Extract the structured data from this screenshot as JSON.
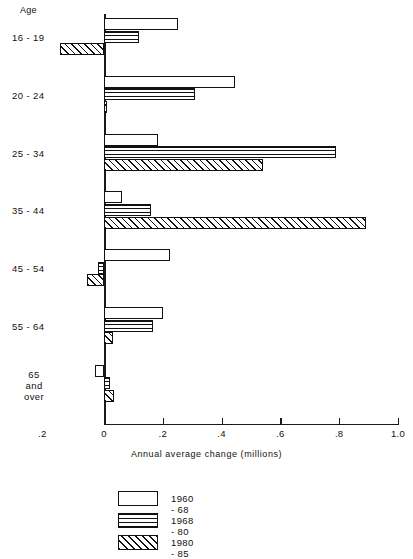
{
  "axis_header": "Age",
  "x_axis_title": "Annual average change (millions)",
  "x_ticks": [
    {
      "label": ".2",
      "value": -0.2
    },
    {
      "label": "0",
      "value": 0
    },
    {
      "label": ".2",
      "value": 0.2
    },
    {
      "label": ".4",
      "value": 0.4
    },
    {
      "label": ".6",
      "value": 0.6
    },
    {
      "label": ".8",
      "value": 0.8
    },
    {
      "label": "1.0",
      "value": 1.0
    }
  ],
  "legend": [
    {
      "label": "1960 - 68",
      "pattern": "solid-white"
    },
    {
      "label": "1968 - 80",
      "pattern": "horizontal-lines"
    },
    {
      "label": "1980 - 85",
      "pattern": "diagonal-hatch"
    }
  ],
  "chart_data": {
    "type": "bar",
    "orientation": "horizontal",
    "title": "",
    "xlabel": "Annual average change (millions)",
    "ylabel": "Age",
    "xlim": [
      -0.2,
      1.0
    ],
    "grid": false,
    "legend_position": "bottom",
    "categories": [
      "16 - 19",
      "20 - 24",
      "25 - 34",
      "35 - 44",
      "45 - 54",
      "55 - 64",
      "65\nand\nover"
    ],
    "series": [
      {
        "name": "1960 - 68",
        "values": [
          0.25,
          0.445,
          0.185,
          0.06,
          0.225,
          0.2,
          -0.03
        ]
      },
      {
        "name": "1968 - 80",
        "values": [
          0.12,
          0.31,
          0.79,
          0.16,
          -0.02,
          0.165,
          0.02
        ]
      },
      {
        "name": "1980 - 85",
        "values": [
          -0.15,
          0.01,
          0.54,
          0.89,
          -0.058,
          0.03,
          0.035
        ]
      }
    ]
  }
}
